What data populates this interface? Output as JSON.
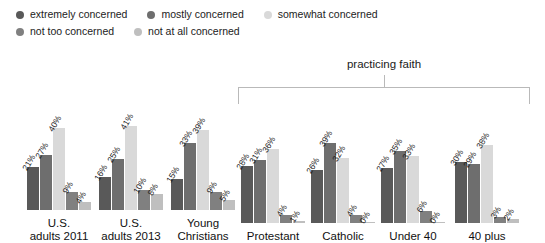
{
  "legend": {
    "rows": [
      [
        {
          "label": "extremely concerned",
          "color": "#595959",
          "icon": "legend-dot-icon"
        },
        {
          "label": "mostly concerned",
          "color": "#6e6e6e",
          "icon": "legend-dot-icon"
        },
        {
          "label": "somewhat concerned",
          "color": "#d9d9d9",
          "icon": "legend-dot-icon"
        }
      ],
      [
        {
          "label": "not too concerned",
          "color": "#808080",
          "icon": "legend-dot-icon"
        },
        {
          "label": "not at all concerned",
          "color": "#bfbfbf",
          "icon": "legend-dot-icon"
        }
      ]
    ]
  },
  "annotation": {
    "bracket_label": "practicing faith"
  },
  "chart_data": {
    "type": "bar",
    "title": "",
    "xlabel": "",
    "ylabel": "",
    "ylim": [
      0,
      45
    ],
    "grid": false,
    "legend_position": "top-left",
    "value_suffix": "%",
    "categories": [
      "U.S.\nadults 2011",
      "U.S.\nadults 2013",
      "Young\nChristians",
      "Protestant",
      "Catholic",
      "Under 40",
      "40 plus"
    ],
    "series": [
      {
        "name": "extremely concerned",
        "color": "#595959",
        "values": [
          21,
          16,
          15,
          28,
          26,
          27,
          30
        ]
      },
      {
        "name": "mostly concerned",
        "color": "#6e6e6e",
        "values": [
          27,
          25,
          33,
          31,
          39,
          35,
          29
        ]
      },
      {
        "name": "somewhat concerned",
        "color": "#d9d9d9",
        "values": [
          40,
          41,
          39,
          36,
          32,
          33,
          38
        ]
      },
      {
        "name": "not too concerned",
        "color": "#808080",
        "values": [
          9,
          10,
          9,
          4,
          4,
          6,
          3
        ]
      },
      {
        "name": "not at all concerned",
        "color": "#bfbfbf",
        "values": [
          4,
          8,
          5,
          1,
          0,
          0,
          2
        ]
      }
    ],
    "value_labels": [
      [
        "21%",
        "27%",
        "40%",
        "9%",
        "4%"
      ],
      [
        "16%",
        "25%",
        "41%",
        "10%",
        "8%"
      ],
      [
        "15%",
        "33%",
        "39%",
        "9%",
        "5%"
      ],
      [
        "28%",
        "31%",
        "36%",
        "4%",
        "1%"
      ],
      [
        "26%",
        "39%",
        "32%",
        "4%",
        "0%"
      ],
      [
        "27%",
        "35%",
        "33%",
        "6%",
        "0%"
      ],
      [
        "30%",
        "29%",
        "38%",
        "3%",
        "2%"
      ]
    ]
  }
}
